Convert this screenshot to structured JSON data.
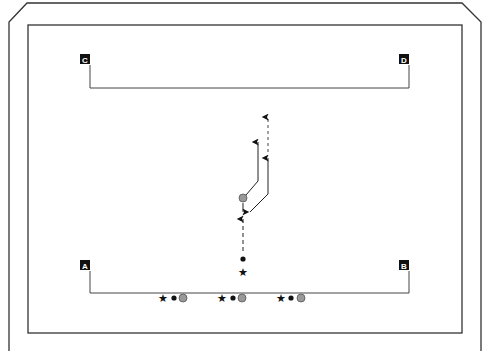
{
  "diagram": {
    "type": "drill-diagram",
    "colors": {
      "line": "#222222",
      "field_line": "#555555",
      "cone_fill": "#999999",
      "cone_stroke": "#555555",
      "label_bg": "#111111",
      "label_text": "#ffffff"
    },
    "corner_labels": [
      {
        "id": "A",
        "label": "A"
      },
      {
        "id": "B",
        "label": "B"
      },
      {
        "id": "C",
        "label": "C"
      },
      {
        "id": "D",
        "label": "D"
      }
    ],
    "legend_symbols": {
      "star": "★",
      "dot": "●",
      "circle": "grey-circle"
    },
    "player_groups": [
      {
        "name": "group-left"
      },
      {
        "name": "group-center"
      },
      {
        "name": "group-right"
      }
    ],
    "routes": [
      {
        "name": "solid-route-left",
        "style": "solid"
      },
      {
        "name": "solid-route-right",
        "style": "solid"
      },
      {
        "name": "dashed-pass-up",
        "style": "dashed"
      },
      {
        "name": "dashed-pass-center",
        "style": "dashed"
      }
    ]
  }
}
